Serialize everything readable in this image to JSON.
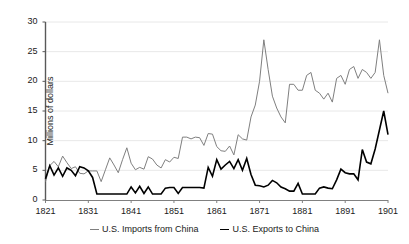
{
  "chart_data": {
    "type": "line",
    "title": "",
    "xlabel": "",
    "ylabel": "Millions of dollars",
    "xlim": [
      1821,
      1901
    ],
    "ylim": [
      0,
      30
    ],
    "grid": true,
    "legend_position": "bottom",
    "xticks": [
      "1821",
      "1831",
      "1841",
      "1851",
      "1861",
      "1871",
      "1881",
      "1891",
      "1901"
    ],
    "yticks": [
      "0",
      "5",
      "10",
      "15",
      "20",
      "25",
      "30"
    ],
    "x": [
      1821,
      1822,
      1823,
      1824,
      1825,
      1826,
      1827,
      1828,
      1829,
      1830,
      1831,
      1832,
      1833,
      1834,
      1835,
      1836,
      1837,
      1838,
      1839,
      1840,
      1841,
      1842,
      1843,
      1844,
      1845,
      1846,
      1847,
      1848,
      1849,
      1850,
      1851,
      1852,
      1853,
      1854,
      1855,
      1856,
      1857,
      1858,
      1859,
      1860,
      1861,
      1862,
      1863,
      1864,
      1865,
      1866,
      1867,
      1868,
      1869,
      1870,
      1871,
      1872,
      1873,
      1874,
      1875,
      1876,
      1877,
      1878,
      1879,
      1880,
      1881,
      1882,
      1883,
      1884,
      1885,
      1886,
      1887,
      1888,
      1889,
      1890,
      1891,
      1892,
      1893,
      1894,
      1895,
      1896,
      1897,
      1898,
      1899,
      1900,
      1901
    ],
    "series": [
      {
        "name": "U.S. Imports from China",
        "color": "#7f7f7f",
        "values": [
          3.1,
          5.8,
          6.5,
          5.6,
          7.4,
          6.3,
          5.3,
          5.6,
          4.5,
          4.4,
          4.9,
          4.9,
          4.9,
          3.1,
          5.1,
          7.1,
          5.9,
          4.6,
          6.8,
          8.8,
          6.2,
          5.1,
          5.5,
          5.2,
          7.3,
          6.9,
          5.9,
          5.4,
          6.8,
          6.4,
          7.2,
          7.0,
          10.6,
          10.6,
          10.3,
          10.6,
          10.5,
          9.2,
          11.2,
          11.1,
          9.0,
          8.3,
          8.2,
          9.1,
          7.6,
          11.0,
          10.3,
          10.1,
          14.0,
          16.0,
          20.0,
          27.0,
          22.0,
          17.5,
          15.5,
          14.0,
          13.0,
          19.5,
          19.5,
          18.5,
          18.5,
          21.0,
          21.5,
          18.5,
          18.0,
          17.0,
          18.0,
          16.5,
          20.5,
          21.0,
          19.5,
          22.0,
          22.5,
          20.5,
          22.0,
          21.5,
          20.5,
          21.5,
          27.0,
          21.0,
          18.0
        ],
        "style": "solid",
        "width": 1
      },
      {
        "name": "U.S. Exports to China",
        "color": "#000000",
        "values": [
          3.6,
          5.8,
          4.2,
          5.4,
          4.0,
          5.4,
          5.0,
          4.1,
          5.6,
          5.4,
          4.9,
          3.8,
          1.0,
          1.0,
          1.0,
          1.0,
          1.0,
          1.0,
          1.0,
          1.0,
          2.2,
          1.2,
          2.3,
          1.1,
          2.2,
          1.0,
          1.0,
          1.0,
          2.0,
          2.1,
          2.1,
          1.1,
          2.1,
          2.1,
          2.1,
          2.1,
          2.1,
          2.0,
          5.5,
          4.0,
          6.8,
          5.2,
          5.9,
          6.5,
          5.3,
          6.8,
          5.0,
          7.0,
          4.3,
          2.5,
          2.4,
          2.2,
          2.5,
          3.3,
          2.9,
          2.2,
          1.9,
          1.5,
          1.5,
          2.8,
          1.0,
          1.0,
          1.0,
          1.0,
          2.0,
          2.2,
          2.0,
          1.9,
          3.4,
          5.2,
          4.6,
          4.4,
          4.4,
          3.4,
          3.9,
          6.0,
          5.1,
          4.5,
          6.0,
          5.2,
          5.3
        ],
        "style": "solid",
        "width": 1.6
      }
    ],
    "export_tail": {
      "note": "black series continues to a peak near 15 at 1899 then falls to ~11 at 1901",
      "values_1891_1901": [
        4.6,
        4.4,
        4.4,
        3.4,
        8.5,
        6.4,
        6.1,
        8.6,
        11.8,
        15.0,
        11.0
      ]
    }
  }
}
